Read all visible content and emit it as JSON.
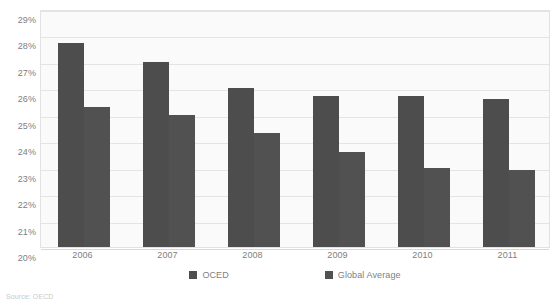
{
  "chart_data": {
    "type": "bar",
    "title": "",
    "xlabel": "",
    "ylabel": "",
    "categories": [
      "2006",
      "2007",
      "2008",
      "2009",
      "2010",
      "2011"
    ],
    "series": [
      {
        "name": "OCED",
        "color": "#4d4d4d",
        "values": [
          27.7,
          27.0,
          26.0,
          25.7,
          25.7,
          25.6
        ]
      },
      {
        "name": "Global Average",
        "color": "#515151",
        "values": [
          25.3,
          25.0,
          24.3,
          23.6,
          23.0,
          22.9
        ]
      }
    ],
    "ylim": [
      20,
      29
    ],
    "ytick_step": 1,
    "ytick_labels": [
      "29%",
      "28%",
      "27%",
      "26%",
      "25%",
      "24%",
      "23%",
      "22%",
      "21%",
      "20%"
    ],
    "ytick_values": [
      29,
      28,
      27,
      26,
      25,
      24,
      23,
      22,
      21,
      20
    ],
    "grid": true,
    "grid_axis": "y",
    "legend_position": "bottom-center",
    "plot_background": "#fafafa",
    "grid_color": "#e4e4e4",
    "border_color": "#e2e2e2",
    "text_color": "#808080"
  },
  "source_note": "Source: OECD"
}
